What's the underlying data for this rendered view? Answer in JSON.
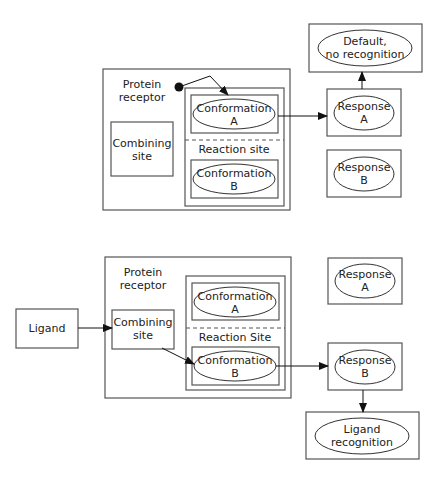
{
  "diagrams": [
    {
      "name": "default-no-ligand",
      "protein_receptor": {
        "label_line1": "Protein",
        "label_line2": "receptor"
      },
      "combining_site": {
        "line1": "Combining",
        "line2": "site"
      },
      "reaction_site": {
        "label": "Reaction site"
      },
      "conformation_a": {
        "line1": "Conformation",
        "line2": "A"
      },
      "conformation_b": {
        "line1": "Conformation",
        "line2": "B"
      },
      "response_a": {
        "line1": "Response",
        "line2": "A"
      },
      "response_b": {
        "line1": "Response",
        "line2": "B"
      },
      "outcome": {
        "line1": "Default,",
        "line2": "no recognition"
      }
    },
    {
      "name": "ligand-bound",
      "ligand": {
        "label": "Ligand"
      },
      "protein_receptor": {
        "label_line1": "Protein",
        "label_line2": "receptor"
      },
      "combining_site": {
        "line1": "Combining",
        "line2": "site"
      },
      "reaction_site": {
        "label": "Reaction Site"
      },
      "conformation_a": {
        "line1": "Conformation",
        "line2": "A"
      },
      "conformation_b": {
        "line1": "Conformation",
        "line2": "B"
      },
      "response_a": {
        "line1": "Response",
        "line2": "A"
      },
      "response_b": {
        "line1": "Response",
        "line2": "B"
      },
      "outcome": {
        "line1": "Ligand",
        "line2": "recognition"
      }
    }
  ]
}
